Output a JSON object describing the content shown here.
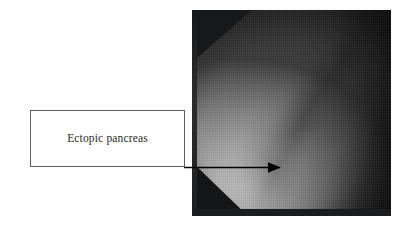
{
  "figure": {
    "background_color": "#ffffff",
    "width": 419,
    "height": 228
  },
  "callout": {
    "label": "Ectopic pancreas",
    "border_color": "#5e5e5e",
    "fill_color": "#ffffff",
    "text_color": "#2a2a2a"
  },
  "arrow": {
    "color": "#000000",
    "direction": "right",
    "description": "leader line from label box to lesion"
  },
  "photo": {
    "modality": "endoscopy",
    "color_mode": "grayscale",
    "border_color": "#1b1c1e",
    "highlight_color": "#c2c2c2",
    "shadow_color": "#17181a",
    "midtone_color": "#8a8a8a"
  }
}
